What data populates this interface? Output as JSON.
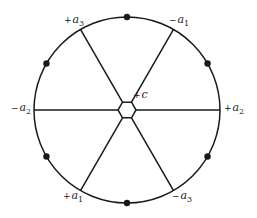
{
  "diagram": {
    "type": "circle-with-hexagon-spokes",
    "stroke_color": "#1a1a1a",
    "center": {
      "x": 127,
      "y": 110
    },
    "circle_radius": 93,
    "hexagon_radius": 9,
    "spoke_angles_deg": [
      0,
      60,
      120,
      180,
      240,
      300
    ],
    "dot_angles_deg": [
      30,
      90,
      150,
      210,
      270,
      330
    ],
    "center_label": {
      "sign": "+",
      "text": "c"
    },
    "spoke_labels": [
      {
        "id": "pos-a2",
        "sign": "+",
        "base": "a",
        "sub": "2",
        "angle": 0
      },
      {
        "id": "neg-a1",
        "sign": "−",
        "base": "a",
        "sub": "1",
        "angle": 60
      },
      {
        "id": "pos-a3",
        "sign": "+",
        "base": "a",
        "sub": "3",
        "angle": 120
      },
      {
        "id": "neg-a2",
        "sign": "−",
        "base": "a",
        "sub": "2",
        "angle": 180
      },
      {
        "id": "pos-a1",
        "sign": "+",
        "base": "a",
        "sub": "1",
        "angle": 240
      },
      {
        "id": "neg-a3",
        "sign": "−",
        "base": "a",
        "sub": "3",
        "angle": 300
      }
    ]
  }
}
